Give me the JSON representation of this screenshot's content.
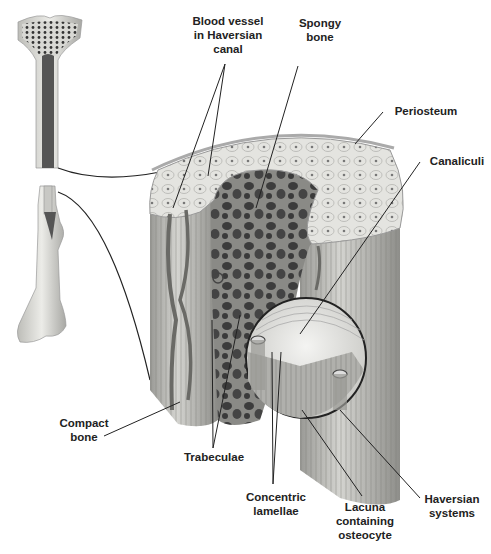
{
  "diagram": {
    "labels": {
      "blood_vessel": "Blood vessel\nin Haversian\ncanal",
      "spongy_bone": "Spongy\nbone",
      "periosteum": "Periosteum",
      "canaliculi": "Canaliculi",
      "compact_bone": "Compact\nbone",
      "trabeculae": "Trabeculae",
      "concentric_lamellae": "Concentric\nlamellae",
      "lacuna": "Lacuna\ncontaining\nosteocyte",
      "haversian_systems": "Haversian\nsystems"
    },
    "colors": {
      "bone_light": "#e8e8e4",
      "bone_mid": "#b8b8b4",
      "spongy_dark": "#4a4a4a",
      "leader_line": "#222222"
    }
  }
}
